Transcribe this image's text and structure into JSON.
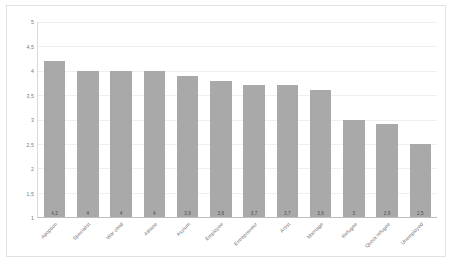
{
  "chart_data": {
    "type": "bar",
    "title": "",
    "xlabel": "",
    "ylabel": "",
    "ylim": [
      1,
      5
    ],
    "ytick_labels": [
      "5",
      "4,5",
      "4",
      "3,5",
      "3",
      "2,5",
      "2",
      "1,5",
      "1"
    ],
    "yticks": [
      5,
      4.5,
      4,
      3.5,
      3,
      2.5,
      2,
      1.5,
      1
    ],
    "grid": true,
    "legend": "none",
    "bar_color": "#a9a9a9",
    "decimal_separator": ",",
    "categories": [
      "Adoption",
      "Specialist",
      "War child",
      "Athlete",
      "Asylum",
      "Employee",
      "Entrepreneur",
      "Artist",
      "Marriage",
      "Refugee",
      "Quota refugee",
      "Unemployed"
    ],
    "values": [
      4.2,
      4,
      4,
      4,
      3.9,
      3.8,
      3.7,
      3.7,
      3.6,
      3,
      2.9,
      2.5
    ],
    "value_labels": [
      "4,2",
      "4",
      "4",
      "4",
      "3,9",
      "3,8",
      "3,7",
      "3,7",
      "3,6",
      "3",
      "2,9",
      "2,5"
    ]
  }
}
